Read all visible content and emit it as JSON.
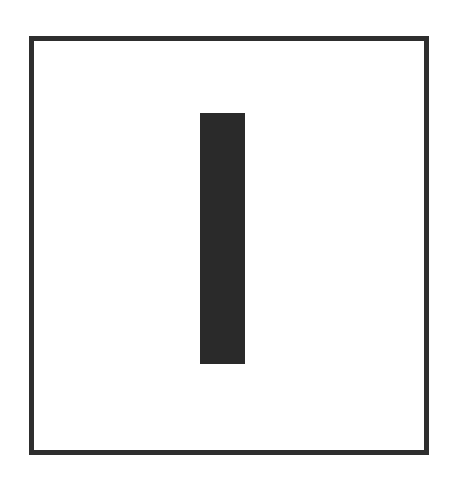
{
  "diagram": {
    "frame": {
      "shape": "rectangle-outline",
      "stroke_color": "#2e2e2e",
      "fill_color": "#ffffff"
    },
    "bar": {
      "shape": "vertical-rectangle",
      "fill_color": "#2a2a2a"
    },
    "background_color": "#ffffff"
  }
}
